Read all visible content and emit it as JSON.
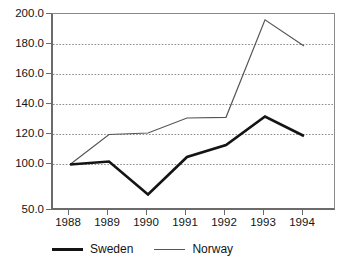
{
  "chart_data": {
    "type": "line",
    "title": "",
    "subtitle": "",
    "xlabel": "",
    "ylabel": "",
    "categories": [
      "1988",
      "1989",
      "1990",
      "1991",
      "1992",
      "1993",
      "1994"
    ],
    "x": [
      1988,
      1989,
      1990,
      1991,
      1992,
      1993,
      1994
    ],
    "series": [
      {
        "name": "Sweden",
        "style": "thick-solid",
        "color": "#141414",
        "values": [
          100.0,
          102.0,
          67.0,
          105.0,
          113.0,
          132.0,
          119.0
        ]
      },
      {
        "name": "Norway",
        "style": "thin-solid",
        "color": "#555555",
        "values": [
          100.0,
          120.0,
          121.0,
          131.0,
          131.5,
          196.5,
          179.0
        ]
      }
    ],
    "ylim": [
      50.0,
      200.0
    ],
    "ytick_labels": [
      "200.0",
      "180.0",
      "160.0",
      "140.0",
      "120.0",
      "100.0",
      "50.0"
    ],
    "ytick_values": [
      200.0,
      180.0,
      160.0,
      140.0,
      120.0,
      100.0,
      50.0
    ],
    "xtick_labels": [
      "1988",
      "1989",
      "1990",
      "1991",
      "1992",
      "1993",
      "1994"
    ],
    "grid": "horizontal-dotted",
    "legend_position": "bottom-left",
    "legend_entries": [
      "Sweden",
      "Norway"
    ]
  },
  "legend": {
    "sweden_label": "Sweden",
    "norway_label": "Norway"
  },
  "axis": {
    "y0": "200.0",
    "y1": "180.0",
    "y2": "160.0",
    "y3": "140.0",
    "y4": "120.0",
    "y5": "100.0",
    "y6": "50.0",
    "x0": "1988",
    "x1": "1989",
    "x2": "1990",
    "x3": "1991",
    "x4": "1992",
    "x5": "1993",
    "x6": "1994"
  },
  "colors": {
    "sweden": "#141414",
    "norway": "#555555",
    "axis": "#6b6b6b",
    "grid": "#8c8c8c",
    "background": "#ffffff"
  }
}
